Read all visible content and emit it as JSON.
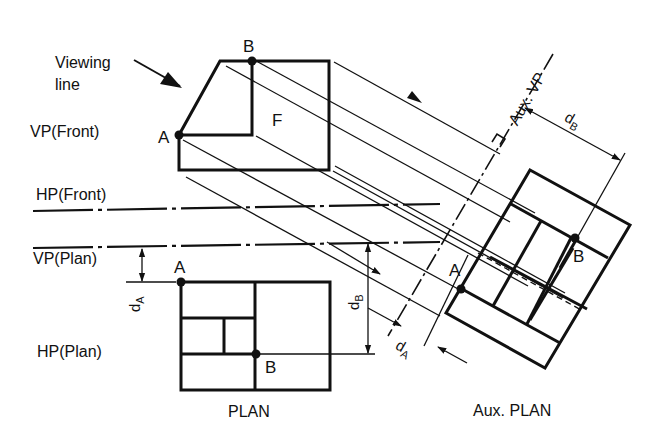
{
  "diagram": {
    "type": "orthographic projection with auxiliary plan",
    "labels": {
      "viewing_line": [
        "Viewing",
        "line"
      ],
      "vp_front": "VP(Front)",
      "hp_front": "HP(Front)",
      "vp_plan": "VP(Plan)",
      "hp_plan": "HP(Plan)",
      "aux_vp": "Aux. VP",
      "plan": "PLAN",
      "aux_plan": "Aux. PLAN",
      "face_f": "F"
    },
    "points": {
      "front_a": "A",
      "front_b": "B",
      "plan_a": "A",
      "plan_b": "B",
      "aux_a": "A",
      "aux_b": "B"
    },
    "dimensions": {
      "d_a_plan": {
        "d": "d",
        "sub": "A"
      },
      "d_b_plan": {
        "d": "d",
        "sub": "B"
      },
      "d_a_aux": {
        "d": "d",
        "sub": "A"
      },
      "d_b_aux": {
        "d": "d",
        "sub": "B"
      }
    },
    "colors": {
      "ink": "#111111",
      "background": "#ffffff"
    }
  }
}
